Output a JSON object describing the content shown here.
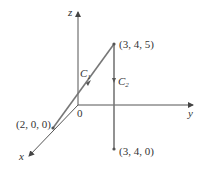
{
  "diagram": {
    "axes": {
      "x_label": "x",
      "y_label": "y",
      "z_label": "z",
      "origin_label": "0"
    },
    "points": [
      {
        "id": "p345",
        "label": "(3, 4, 5)"
      },
      {
        "id": "p340",
        "label": "(3, 4, 0)"
      },
      {
        "id": "p200",
        "label": "(2, 0, 0)"
      }
    ],
    "curves": [
      {
        "id": "c1",
        "name": "C",
        "sub": "1",
        "from": "(2, 0, 0)",
        "to": "(3, 4, 5)"
      },
      {
        "id": "c2",
        "name": "C",
        "sub": "2",
        "from": "(3, 4, 5)",
        "to": "(3, 4, 0)"
      }
    ],
    "colors": {
      "axis": "#555555",
      "curve": "#777777",
      "text": "#333333"
    }
  }
}
